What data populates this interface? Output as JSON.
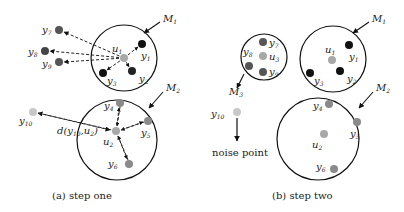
{
  "figure": {
    "panels": [
      {
        "id": "a",
        "caption": "(a)  step one",
        "clusters": [
          {
            "name": "M",
            "sub": "1",
            "center": [
              124,
              58
            ],
            "radius": 33,
            "label_pos": [
              163,
              22
            ],
            "arrow_from": [
              160,
              22
            ],
            "arrow_to": [
              144,
              33
            ]
          },
          {
            "name": "M",
            "sub": "2",
            "center": [
              117,
              140
            ],
            "radius": 40,
            "label_pos": [
              166,
              91
            ],
            "arrow_from": [
              163,
              92
            ],
            "arrow_to": [
              149,
              108
            ]
          }
        ],
        "points": [
          {
            "name": "u",
            "sub": "1",
            "pos": [
              124,
              58
            ],
            "color": "#a8a8a8",
            "label_pos": [
              112,
              52
            ]
          },
          {
            "name": "y",
            "sub": "1",
            "pos": [
              142,
              44
            ],
            "color": "#111111",
            "label_pos": [
              141,
              59
            ]
          },
          {
            "name": "y",
            "sub": "2",
            "pos": [
              132,
              71
            ],
            "color": "#222222",
            "label_pos": [
              139,
              82
            ]
          },
          {
            "name": "y",
            "sub": "3",
            "pos": [
              103,
              73
            ],
            "color": "#111111",
            "label_pos": [
              107,
              84
            ]
          },
          {
            "name": "y",
            "sub": "7",
            "pos": [
              59,
              30
            ],
            "color": "#555555",
            "label_pos": [
              42,
              33
            ]
          },
          {
            "name": "y",
            "sub": "8",
            "pos": [
              45,
              51
            ],
            "color": "#444444",
            "label_pos": [
              28,
              55
            ]
          },
          {
            "name": "y",
            "sub": "9",
            "pos": [
              59,
              62
            ],
            "color": "#555555",
            "label_pos": [
              42,
              67
            ]
          },
          {
            "name": "u",
            "sub": "2",
            "pos": [
              116,
              131
            ],
            "color": "#a8a8a8",
            "label_pos": [
              103,
              145
            ]
          },
          {
            "name": "y",
            "sub": "4",
            "pos": [
              120,
              103
            ],
            "color": "#8a8a8a",
            "label_pos": [
              104,
              109
            ]
          },
          {
            "name": "y",
            "sub": "5",
            "pos": [
              148,
              121
            ],
            "color": "#8a8a8a",
            "label_pos": [
              141,
              136
            ]
          },
          {
            "name": "y",
            "sub": "6",
            "pos": [
              129,
              164
            ],
            "color": "#8a8a8a",
            "label_pos": [
              108,
              167
            ]
          },
          {
            "name": "y",
            "sub": "10",
            "pos": [
              33,
              112
            ],
            "color": "#c8c8c8",
            "label_pos": [
              19,
              124
            ]
          }
        ],
        "annotation": {
          "text_main": "d(y",
          "text_sub": "10",
          "text_tail": ",u",
          "text_sub2": "2",
          "text_close": ")",
          "pos": [
            57,
            134
          ]
        }
      },
      {
        "id": "b",
        "caption": "(b)  step two",
        "clusters": [
          {
            "name": "M",
            "sub": "3",
            "center": [
              264,
              57
            ],
            "radius": 23,
            "label_pos": [
              229,
              95
            ],
            "arrow_from": [
              244,
              74
            ],
            "arrow_to": [
              237,
              88
            ]
          },
          {
            "name": "M",
            "sub": "1",
            "center": [
              333,
              59
            ],
            "radius": 33,
            "label_pos": [
              372,
              22
            ],
            "arrow_from": [
              369,
              22
            ],
            "arrow_to": [
              353,
              33
            ]
          },
          {
            "name": "M",
            "sub": "2",
            "center": [
              318,
              139
            ],
            "radius": 41,
            "label_pos": [
              376,
              91
            ],
            "arrow_from": [
              373,
              92
            ],
            "arrow_to": [
              359,
              108
            ]
          }
        ],
        "points": [
          {
            "name": "y",
            "sub": "7",
            "pos": [
              263,
              42
            ],
            "color": "#555555",
            "label_pos": [
              269,
              46
            ]
          },
          {
            "name": "u",
            "sub": "3",
            "pos": [
              263,
              56
            ],
            "color": "#a8a8a8",
            "label_pos": [
              269,
              60
            ]
          },
          {
            "name": "y",
            "sub": "8",
            "pos": [
              249,
              66
            ],
            "color": "#555555",
            "label_pos": [
              243,
              55
            ]
          },
          {
            "name": "y",
            "sub": "9",
            "pos": [
              263,
              72
            ],
            "color": "#555555",
            "label_pos": [
              269,
              75
            ]
          },
          {
            "name": "u",
            "sub": "1",
            "pos": [
              332,
              60
            ],
            "color": "#a8a8a8",
            "label_pos": [
              325,
              53
            ]
          },
          {
            "name": "y",
            "sub": "1",
            "pos": [
              349,
              45
            ],
            "color": "#111111",
            "label_pos": [
              349,
              60
            ]
          },
          {
            "name": "y",
            "sub": "2",
            "pos": [
              340,
              71
            ],
            "color": "#111111",
            "label_pos": [
              347,
              82
            ]
          },
          {
            "name": "y",
            "sub": "3",
            "pos": [
              310,
              73
            ],
            "color": "#111111",
            "label_pos": [
              314,
              84
            ]
          },
          {
            "name": "y",
            "sub": "4",
            "pos": [
              329,
              104
            ],
            "color": "#8a8a8a",
            "label_pos": [
              313,
              109
            ]
          },
          {
            "name": "y",
            "sub": "5",
            "pos": [
              357,
              122
            ],
            "color": "#8a8a8a",
            "label_pos": [
              350,
              137
            ]
          },
          {
            "name": "u",
            "sub": "2",
            "pos": [
              324,
              134
            ],
            "color": "#a8a8a8",
            "label_pos": [
              312,
              148
            ]
          },
          {
            "name": "y",
            "sub": "6",
            "pos": [
              334,
              169
            ],
            "color": "#8a8a8a",
            "label_pos": [
              316,
              170
            ]
          },
          {
            "name": "y",
            "sub": "10",
            "pos": [
              237,
              112
            ],
            "color": "#c8c8c8",
            "label_pos": [
              211,
              117
            ]
          }
        ],
        "noise": {
          "label": "noise point",
          "pos": [
            212,
            156
          ],
          "arrow_from": [
            237,
            118
          ],
          "arrow_to": [
            237,
            141
          ]
        }
      }
    ]
  }
}
